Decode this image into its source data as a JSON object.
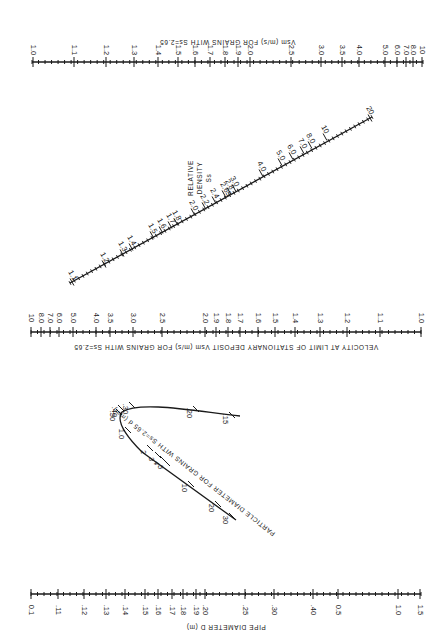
{
  "figure": {
    "orientation": "rotated 90 degrees (landscape nomograph shown upright on page)",
    "scales": {
      "vsm_top": {
        "title": "Vsm (m/s) FOR GRAINS WITH Ss=2.65",
        "line": {
          "y": 62,
          "x1": 32,
          "x2": 423
        },
        "ticks": [
          {
            "label": "1.0",
            "x": 33
          },
          {
            "label": "1.1",
            "x": 74
          },
          {
            "label": "1.2",
            "x": 106
          },
          {
            "label": "1.3",
            "x": 134
          },
          {
            "label": "1.4",
            "x": 158
          },
          {
            "label": "1.5",
            "x": 178
          },
          {
            "label": "1.6",
            "x": 195
          },
          {
            "label": "1.7",
            "x": 210
          },
          {
            "label": "1.8",
            "x": 225
          },
          {
            "label": "1.9",
            "x": 238
          },
          {
            "label": "2.0",
            "x": 250
          },
          {
            "label": "2.5",
            "x": 291
          },
          {
            "label": "3.0",
            "x": 321
          },
          {
            "label": "3.5",
            "x": 342
          },
          {
            "label": "4.0",
            "x": 359
          },
          {
            "label": "5.0",
            "x": 385
          },
          {
            "label": "6.0",
            "x": 397
          },
          {
            "label": "7.0",
            "x": 406
          },
          {
            "label": "8.0",
            "x": 413
          },
          {
            "label": "10",
            "x": 422
          }
        ]
      },
      "relative_density": {
        "title_lines": [
          "RELATIVE",
          "DENSITY",
          "Ss"
        ],
        "line": {
          "x1": 70,
          "y1": 283,
          "x2": 372,
          "y2": 117
        },
        "ticks": [
          {
            "label": "1.1",
            "x": 72,
            "y": 282
          },
          {
            "label": "1.2",
            "x": 104,
            "y": 264
          },
          {
            "label": "1.3",
            "x": 122,
            "y": 253
          },
          {
            "label": "1.4",
            "x": 131,
            "y": 247
          },
          {
            "label": "1.5",
            "x": 152,
            "y": 235
          },
          {
            "label": "1.6",
            "x": 161,
            "y": 230
          },
          {
            "label": "1.7",
            "x": 170,
            "y": 225
          },
          {
            "label": "1.8",
            "x": 176,
            "y": 222
          },
          {
            "label": "2.0",
            "x": 193,
            "y": 212
          },
          {
            "label": "2.2",
            "x": 204,
            "y": 206
          },
          {
            "label": "2.4",
            "x": 214,
            "y": 200
          },
          {
            "label": "2.65",
            "x": 224,
            "y": 194
          },
          {
            "label": "2.8",
            "x": 229,
            "y": 191
          },
          {
            "label": "3.0",
            "x": 234,
            "y": 188
          },
          {
            "label": "4.0",
            "x": 261,
            "y": 173
          },
          {
            "label": "5.0",
            "x": 280,
            "y": 162
          },
          {
            "label": "6.0",
            "x": 291,
            "y": 156
          },
          {
            "label": "7.0",
            "x": 302,
            "y": 150
          },
          {
            "label": "8.0",
            "x": 310,
            "y": 145
          },
          {
            "label": "10",
            "x": 325,
            "y": 137
          },
          {
            "label": "20",
            "x": 370,
            "y": 118
          }
        ]
      },
      "vsm_middle": {
        "title": "VELOCITY AT LIMIT OF STATIONARY DEPOSIT Vsm (m/s) FOR GRAINS WITH Ss=2.65",
        "line": {
          "y": 332,
          "x1": 31,
          "x2": 421
        },
        "ticks": [
          {
            "label": "10",
            "x": 31
          },
          {
            "label": "8.0",
            "x": 41
          },
          {
            "label": "7.0",
            "x": 50
          },
          {
            "label": "6.0",
            "x": 59
          },
          {
            "label": "5.0",
            "x": 73
          },
          {
            "label": "4.0",
            "x": 96
          },
          {
            "label": "3.5",
            "x": 110
          },
          {
            "label": "3.0",
            "x": 133
          },
          {
            "label": "2.5",
            "x": 162
          },
          {
            "label": "2.0",
            "x": 205
          },
          {
            "label": "1.9",
            "x": 216
          },
          {
            "label": "1.8",
            "x": 228
          },
          {
            "label": "1.7",
            "x": 240
          },
          {
            "label": "1.6",
            "x": 258
          },
          {
            "label": "1.5",
            "x": 275
          },
          {
            "label": "1.4",
            "x": 295
          },
          {
            "label": "1.3",
            "x": 320
          },
          {
            "label": "1.2",
            "x": 347
          },
          {
            "label": "1.1",
            "x": 380
          },
          {
            "label": "1.0",
            "x": 421
          }
        ]
      },
      "particle_diameter": {
        "title": "PARTICLE DIAMETER FOR GRAINS WITH Ss=2.65 d (mm)",
        "curve_path": "M 240 416 C 200 412, 140 400, 122 412 C 116 420, 125 435, 142 452 L 236 520",
        "ticks": [
          {
            "label": ".15",
            "x": 232,
            "y": 415
          },
          {
            "label": ".20",
            "x": 196,
            "y": 409
          },
          {
            "label": ".30",
            "x": 132,
            "y": 405
          },
          {
            "label": ".40",
            "x": 121,
            "y": 408
          },
          {
            "label": ".50",
            "x": 119,
            "y": 412
          },
          {
            "label": "1.0",
            "x": 128,
            "y": 430
          },
          {
            "label": "2",
            "x": 150,
            "y": 448
          },
          {
            "label": "3",
            "x": 158,
            "y": 455
          },
          {
            "label": "4",
            "x": 163,
            "y": 459
          },
          {
            "label": "5",
            "x": 167,
            "y": 463
          },
          {
            "label": "10",
            "x": 191,
            "y": 484
          },
          {
            "label": "20",
            "x": 218,
            "y": 504
          },
          {
            "label": "30",
            "x": 232,
            "y": 516
          }
        ]
      },
      "pipe_diameter": {
        "title": "PIPE DIAMETER D (m)",
        "line": {
          "y": 594,
          "x1": 31,
          "x2": 421
        },
        "ticks": [
          {
            "label": "0.1",
            "x": 31
          },
          {
            "label": ".11",
            "x": 58
          },
          {
            "label": ".12",
            "x": 84
          },
          {
            "label": ".13",
            "x": 106
          },
          {
            "label": ".14",
            "x": 125
          },
          {
            "label": ".15",
            "x": 145
          },
          {
            "label": ".16",
            "x": 158
          },
          {
            "label": ".17",
            "x": 172
          },
          {
            "label": ".18",
            "x": 183
          },
          {
            "label": ".19",
            "x": 196
          },
          {
            "label": ".20",
            "x": 205
          },
          {
            "label": ".25",
            "x": 245
          },
          {
            "label": ".30",
            "x": 274
          },
          {
            "label": ".40",
            "x": 313
          },
          {
            "label": "0.5",
            "x": 338
          },
          {
            "label": "1.0",
            "x": 398
          },
          {
            "label": "1.5",
            "x": 420
          }
        ]
      }
    }
  }
}
